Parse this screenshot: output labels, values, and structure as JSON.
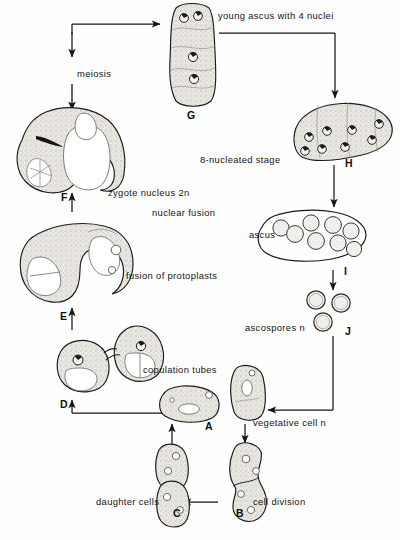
{
  "figure": {
    "ink_color": "#151515",
    "cytoplasm_fill": "#e8e6e1",
    "background": "#ffffff"
  },
  "labels": [
    {
      "id": "young-ascus",
      "text": "young ascus with 4 nuclei",
      "x": 218,
      "y": 11,
      "italic": false
    },
    {
      "id": "meiosis",
      "text": "meiosis",
      "x": 77,
      "y": 69,
      "italic": false
    },
    {
      "id": "eight-nucleated",
      "text": "8-nucleated stage",
      "x": 200,
      "y": 155,
      "italic": false
    },
    {
      "id": "zygote-nucleus",
      "text": "zygote nucleus 2n",
      "x": 108,
      "y": 188,
      "italic": false
    },
    {
      "id": "nuclear-fusion",
      "text": "nuclear fusion",
      "x": 152,
      "y": 208,
      "italic": false
    },
    {
      "id": "ascus",
      "text": "ascus",
      "x": 249,
      "y": 230,
      "italic": false
    },
    {
      "id": "fusion-protoplasts",
      "text": "fusion of protoplasts",
      "x": 126,
      "y": 271,
      "italic": false
    },
    {
      "id": "ascospores",
      "text": "ascospores n",
      "x": 245,
      "y": 323,
      "italic": false
    },
    {
      "id": "copulation-tubes",
      "text": "copulation tubes",
      "x": 143,
      "y": 365,
      "italic": false
    },
    {
      "id": "vegetative-cell",
      "text": "vegetative cell n",
      "x": 253,
      "y": 418,
      "italic": false
    },
    {
      "id": "cell-division",
      "text": "cell division",
      "x": 253,
      "y": 497,
      "italic": false
    },
    {
      "id": "daughter-cells",
      "text": "daughter cells",
      "x": 96,
      "y": 497,
      "italic": false
    }
  ],
  "stage_letters": [
    {
      "id": "A",
      "text": "A",
      "x": 205,
      "y": 421
    },
    {
      "id": "B",
      "text": "B",
      "x": 236,
      "y": 508
    },
    {
      "id": "C",
      "text": "C",
      "x": 173,
      "y": 508
    },
    {
      "id": "D",
      "text": "D",
      "x": 60,
      "y": 399
    },
    {
      "id": "E",
      "text": "E",
      "x": 60,
      "y": 311
    },
    {
      "id": "F",
      "text": "F",
      "x": 61,
      "y": 192
    },
    {
      "id": "G",
      "text": "G",
      "x": 187,
      "y": 110
    },
    {
      "id": "H",
      "text": "H",
      "x": 345,
      "y": 158
    },
    {
      "id": "I",
      "text": "I",
      "x": 344,
      "y": 266
    },
    {
      "id": "J",
      "text": "J",
      "x": 345,
      "y": 326
    }
  ],
  "cells": [
    {
      "id": "cell-A",
      "name": "vegetative-cell-A",
      "stage": "A",
      "description": "single oval vegetative cell with vacuole and nucleus"
    },
    {
      "id": "cell-B",
      "name": "dividing-cell-B",
      "stage": "B",
      "description": "elongated cell constricting during cell division"
    },
    {
      "id": "cell-C",
      "name": "daughter-cells-C",
      "stage": "C",
      "description": "two separated daughter cells"
    },
    {
      "id": "cell-D",
      "name": "conjugating-cells-D",
      "stage": "D",
      "description": "two cells joined by copulation tubes"
    },
    {
      "id": "cell-E",
      "name": "protoplast-fusion-E",
      "stage": "E",
      "description": "fused pair of cells, protoplasts merging"
    },
    {
      "id": "cell-F",
      "name": "zygote-F",
      "stage": "F",
      "description": "zygote with diploid 2n nucleus after nuclear fusion"
    },
    {
      "id": "cell-G",
      "name": "young-ascus-G",
      "stage": "G",
      "description": "young ascus containing 4 nuclei after meiosis"
    },
    {
      "id": "cell-H",
      "name": "eight-nucleated-ascus-H",
      "stage": "H",
      "description": "ascus at the 8-nucleated stage"
    },
    {
      "id": "cell-I",
      "name": "mature-ascus-I",
      "stage": "I",
      "description": "mature ascus containing 8 ascospores"
    },
    {
      "id": "cell-J",
      "name": "free-ascospores-J",
      "stage": "J",
      "description": "three liberated haploid ascospores"
    }
  ],
  "arrows": [
    {
      "id": "arrow-C-to-A",
      "from": "C",
      "to": "A",
      "shape": "vertical-up"
    },
    {
      "id": "arrow-B-to-C",
      "from": "B",
      "to": "C",
      "shape": "horizontal-left"
    },
    {
      "id": "arrow-A-to-B",
      "from": "A",
      "to": "B",
      "shape": "vertical-down-right-branch"
    },
    {
      "id": "arrow-A-to-D",
      "from": "A",
      "to": "D",
      "shape": "left-then-up"
    },
    {
      "id": "arrow-D-to-E",
      "from": "D",
      "to": "E",
      "shape": "vertical-up"
    },
    {
      "id": "arrow-E-to-F",
      "from": "E",
      "to": "F",
      "shape": "vertical-up"
    },
    {
      "id": "arrow-F-to-G",
      "from": "F",
      "to": "G",
      "shape": "up-then-right"
    },
    {
      "id": "arrow-G-to-H",
      "from": "G",
      "to": "H",
      "shape": "right-then-down"
    },
    {
      "id": "arrow-H-to-I",
      "from": "H",
      "to": "I",
      "shape": "vertical-down"
    },
    {
      "id": "arrow-I-to-J",
      "from": "I",
      "to": "J",
      "shape": "vertical-down"
    },
    {
      "id": "arrow-J-to-vegetative",
      "from": "J",
      "to": "A",
      "shape": "down-then-left"
    }
  ]
}
